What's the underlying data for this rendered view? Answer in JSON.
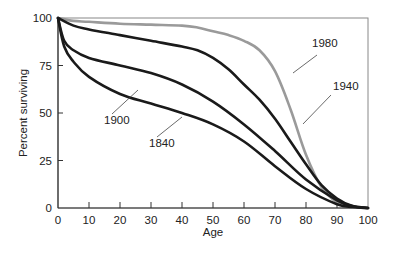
{
  "chart_data": {
    "type": "line",
    "title": "",
    "xlabel": "Age",
    "ylabel": "Percent surviving",
    "xlim": [
      0,
      100
    ],
    "ylim": [
      0,
      100
    ],
    "x_ticks": [
      0,
      10,
      20,
      30,
      40,
      50,
      60,
      70,
      80,
      90,
      100
    ],
    "y_ticks": [
      0,
      25,
      50,
      75,
      100
    ],
    "grid": false,
    "legend": "inline labels with leader lines",
    "series": [
      {
        "name": "1980",
        "color": "#9a9a9a",
        "x": [
          0,
          5,
          10,
          20,
          30,
          40,
          45,
          50,
          55,
          60,
          65,
          70,
          75,
          80,
          85,
          90,
          95,
          100
        ],
        "values": [
          100,
          98.5,
          98,
          97,
          96.5,
          96,
          95,
          93,
          91,
          88,
          83,
          72,
          52,
          28,
          11,
          3,
          0.5,
          0
        ]
      },
      {
        "name": "1940",
        "color": "#1a1a1a",
        "x": [
          0,
          5,
          10,
          20,
          30,
          40,
          45,
          50,
          55,
          60,
          65,
          70,
          75,
          80,
          85,
          90,
          95,
          100
        ],
        "values": [
          100,
          96,
          94,
          91,
          88,
          85,
          83,
          79,
          73,
          65,
          57,
          47,
          35,
          23,
          12,
          5,
          1,
          0
        ]
      },
      {
        "name": "1900",
        "color": "#1a1a1a",
        "x": [
          0,
          2,
          5,
          10,
          20,
          30,
          40,
          50,
          60,
          70,
          80,
          90,
          95,
          100
        ],
        "values": [
          100,
          88,
          83,
          79,
          75,
          71,
          65,
          56,
          44,
          30,
          15,
          4,
          1,
          0
        ]
      },
      {
        "name": "1840",
        "color": "#1a1a1a",
        "x": [
          0,
          2,
          5,
          10,
          20,
          30,
          40,
          50,
          60,
          70,
          80,
          90,
          95,
          100
        ],
        "values": [
          100,
          85,
          77,
          69,
          60,
          55,
          50,
          44,
          35,
          22,
          10,
          2,
          0.5,
          0
        ]
      }
    ],
    "annotations": [
      {
        "text": "1980",
        "x_px": 312,
        "y_px": 47,
        "line": [
          [
            317,
            55
          ],
          [
            293,
            73
          ]
        ]
      },
      {
        "text": "1940",
        "x_px": 333,
        "y_px": 90,
        "line": [
          [
            331,
            95
          ],
          [
            303,
            124
          ]
        ]
      },
      {
        "text": "1900",
        "x_px": 104,
        "y_px": 124,
        "line": [
          [
            112,
            114
          ],
          [
            138,
            90
          ]
        ]
      },
      {
        "text": "1840",
        "x_px": 149,
        "y_px": 147,
        "line": [
          [
            157,
            137
          ],
          [
            182,
            117
          ]
        ]
      }
    ]
  }
}
